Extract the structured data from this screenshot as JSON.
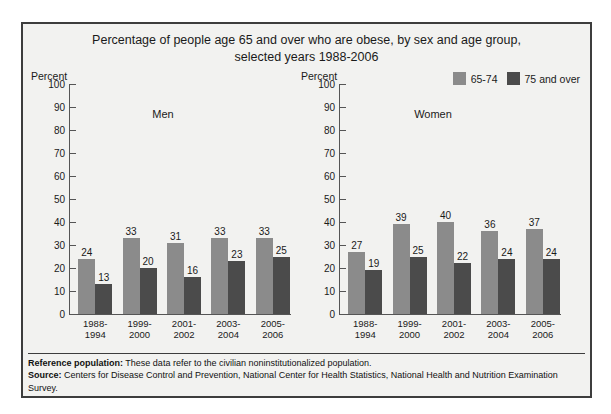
{
  "title": {
    "line1": "Percentage of people age 65 and over who are obese, by sex and age group,",
    "line2": "selected years 1988-2006"
  },
  "legend": {
    "items": [
      {
        "label": "65-74",
        "color": "#8b8b8b"
      },
      {
        "label": "75 and over",
        "color": "#4b4b4b"
      }
    ]
  },
  "axis": {
    "title": "Percent",
    "ticks": [
      "100",
      "90",
      "80",
      "70",
      "60",
      "50",
      "40",
      "30",
      "20",
      "10",
      "0"
    ]
  },
  "panels": {
    "men": {
      "name": "Men",
      "axis_title": "Percent"
    },
    "women": {
      "name": "Women",
      "axis_title": "Percent"
    }
  },
  "categories": [
    {
      "line1": "1988-",
      "line2": "1994"
    },
    {
      "line1": "1999-",
      "line2": "2000"
    },
    {
      "line1": "2001-",
      "line2": "2002"
    },
    {
      "line1": "2003-",
      "line2": "2004"
    },
    {
      "line1": "2005-",
      "line2": "2006"
    }
  ],
  "footnotes": {
    "reference_label": "Reference population:",
    "reference_text": " These data refer to the civilian noninstitutionalized population.",
    "source_label": "Source:",
    "source_text": " Centers for Disease Control and Prevention, National Center for Health Statistics, National Health and Nutrition Examination Survey."
  },
  "chart_data": {
    "type": "bar",
    "title": "Percentage of people age 65 and over who are obese, by sex and age group, selected years 1988-2006",
    "xlabel": "",
    "ylabel": "Percent",
    "ylim": [
      0,
      100
    ],
    "ytick_step": 10,
    "grid": false,
    "legend_position": "top-right",
    "categories": [
      "1988-1994",
      "1999-2000",
      "2001-2002",
      "2003-2004",
      "2005-2006"
    ],
    "panels": [
      {
        "name": "Men",
        "series": [
          {
            "name": "65-74",
            "values": [
              24,
              33,
              31,
              33,
              33
            ]
          },
          {
            "name": "75 and over",
            "values": [
              13,
              20,
              16,
              23,
              25
            ]
          }
        ]
      },
      {
        "name": "Women",
        "series": [
          {
            "name": "65-74",
            "values": [
              27,
              39,
              40,
              36,
              37
            ]
          },
          {
            "name": "75 and over",
            "values": [
              19,
              25,
              22,
              24,
              24
            ]
          }
        ]
      }
    ]
  }
}
